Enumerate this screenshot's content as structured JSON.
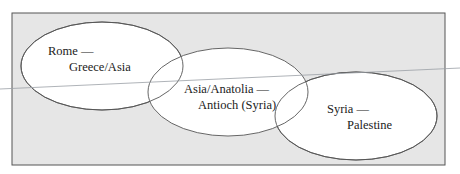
{
  "diagram": {
    "background_box": {
      "fill": "#e6e6e6",
      "stroke": "#555555"
    },
    "regions": [
      {
        "id": "rome",
        "line1": "Rome —",
        "line2": "Greece/Asia"
      },
      {
        "id": "asia",
        "line1": "Asia/Anatolia —",
        "line2": "Antioch (Syria)"
      },
      {
        "id": "syria",
        "line1": "Syria —",
        "line2": "Palestine"
      }
    ],
    "colors": {
      "ellipse_fill": "#ffffff",
      "ellipse_stroke": "#555555",
      "line": "#9aa0a6"
    }
  }
}
